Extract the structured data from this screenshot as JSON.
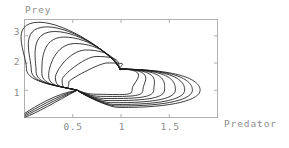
{
  "figure": {
    "background_color": "#ffffff",
    "frame_color": "#b0b0b0",
    "curve_color": "#1a1a1a",
    "text_color": "#8c8c8c"
  },
  "chart_data": {
    "type": "line",
    "title": "",
    "subtitle": "",
    "xlabel": "Predator",
    "ylabel": "Prey",
    "xlim": [
      0,
      2.0
    ],
    "ylim": [
      0,
      3.6
    ],
    "xticks": [
      0.5,
      1,
      1.5
    ],
    "xtick_labels": [
      "0.5",
      "1",
      "1.5"
    ],
    "yticks": [
      1,
      2,
      3
    ],
    "ytick_labels": [
      "1",
      "2",
      "3"
    ],
    "grid": false,
    "legend": "none",
    "crossing_points": [
      {
        "x": 0.545,
        "y": 1.0
      },
      {
        "x": 0.99,
        "y": 1.78
      }
    ],
    "series": [
      {
        "name": "orbit-1",
        "amplitude": 0.12,
        "values": []
      },
      {
        "name": "orbit-2",
        "amplitude": 0.26,
        "values": []
      },
      {
        "name": "orbit-3",
        "amplitude": 0.4,
        "values": []
      },
      {
        "name": "orbit-4",
        "amplitude": 0.54,
        "values": []
      },
      {
        "name": "orbit-5",
        "amplitude": 0.68,
        "values": []
      },
      {
        "name": "orbit-6",
        "amplitude": 0.8,
        "values": []
      },
      {
        "name": "orbit-7",
        "amplitude": 0.9,
        "values": []
      },
      {
        "name": "orbit-8",
        "amplitude": 1.0,
        "values": []
      }
    ]
  },
  "labels": {
    "y_axis_title": "Prey",
    "x_axis_title": "Predator",
    "ytick_3": "3",
    "ytick_2": "2",
    "ytick_1": "1",
    "xtick_05": "0.5",
    "xtick_1": "1",
    "xtick_15": "1.5"
  }
}
